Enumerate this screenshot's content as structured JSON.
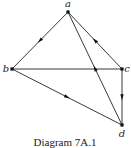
{
  "diagram": {
    "caption": "Diagram 7A.1",
    "vertices": [
      {
        "id": "a",
        "label": "a",
        "x": 68,
        "y": 12,
        "lx": 68,
        "ly": 7,
        "anchor": "middle"
      },
      {
        "id": "b",
        "label": "b",
        "x": 12,
        "y": 69,
        "lx": 6,
        "ly": 72,
        "anchor": "middle"
      },
      {
        "id": "c",
        "label": "c",
        "x": 122,
        "y": 69,
        "lx": 127,
        "ly": 72,
        "anchor": "middle"
      },
      {
        "id": "d",
        "label": "d",
        "x": 122,
        "y": 125,
        "lx": 122,
        "ly": 137,
        "anchor": "middle"
      }
    ],
    "edges": [
      {
        "from": "a",
        "to": "b",
        "directed": true
      },
      {
        "from": "c",
        "to": "a",
        "directed": true
      },
      {
        "from": "d",
        "to": "a",
        "directed": true
      },
      {
        "from": "b",
        "to": "c",
        "directed": false
      },
      {
        "from": "c",
        "to": "d",
        "directed": true
      },
      {
        "from": "b",
        "to": "d",
        "directed": true
      }
    ],
    "colors": {
      "line": "#222222",
      "background": "#ffffff"
    }
  }
}
